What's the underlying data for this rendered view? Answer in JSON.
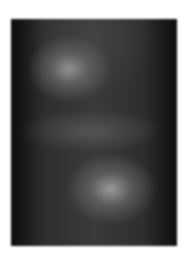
{
  "image": {
    "description": "Blurred grayscale photograph with two soft bright regions on dark background",
    "colors": {
      "background": "#ffffff",
      "frame_dark": "#151515",
      "highlight": "#a0a0a0"
    }
  }
}
